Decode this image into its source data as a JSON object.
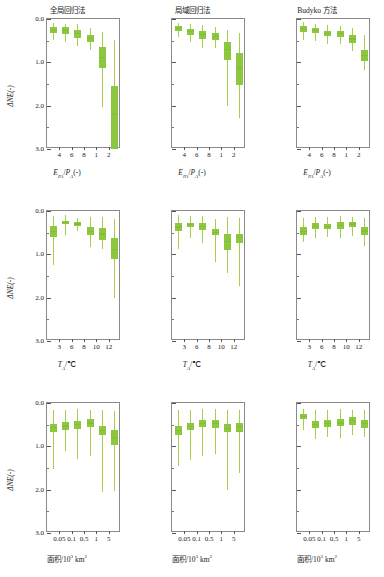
{
  "figure": {
    "ylabel": "ΔNE(-)",
    "y_ticks": [
      "0.0",
      "1.0",
      "2.0",
      "3.0"
    ],
    "ylim_top": 0.0,
    "ylim_bottom": 3.0,
    "box_color": "#8dc63f",
    "whisker_color": "#a8cf4a",
    "axis_color": "#8a8a8a"
  },
  "columns": [
    {
      "title": "全局回归法"
    },
    {
      "title": "局域回归法"
    },
    {
      "title": "Budyko 方法"
    }
  ],
  "rows": [
    {
      "xlabel_html": "<i>E</i><sub>PA</sub>/<i>P</i><sub>A</sub>(-)",
      "xlabel_text": "EPA/PA(-)",
      "x_ticks": [
        "4",
        "6",
        "8",
        "1",
        "2"
      ]
    },
    {
      "xlabel_html": "<i>T</i><sub>A</sub>/℃",
      "xlabel_text": "TA/℃",
      "x_ticks": [
        "3",
        "6",
        "8",
        "10",
        "12"
      ]
    },
    {
      "xlabel_html": "面积/10<sup>3</sup> km<sup>2</sup>",
      "xlabel_text": "面积/10³ km²",
      "x_ticks": [
        "0.05",
        "0.1",
        "0.5",
        "1",
        "5"
      ]
    }
  ],
  "chart_data": {
    "type": "box",
    "title": "",
    "ylabel": "ΔNE(-)",
    "ylim": [
      0.0,
      3.0
    ],
    "y_inverted": true,
    "grid": false,
    "legend": "none",
    "panels": [
      {
        "row": 0,
        "col": 0,
        "title": "全局回归法",
        "xlabel": "EPA/PA(-)",
        "x_ticks": [
          "4",
          "6",
          "8",
          "1",
          "2"
        ],
        "boxes": [
          {
            "whisker_low": 0.1,
            "q1": 0.18,
            "median": 0.26,
            "q3": 0.33,
            "whisker_high": 0.48
          },
          {
            "whisker_low": 0.11,
            "q1": 0.19,
            "median": 0.27,
            "q3": 0.34,
            "whisker_high": 0.52
          },
          {
            "whisker_low": 0.12,
            "q1": 0.26,
            "median": 0.34,
            "q3": 0.43,
            "whisker_high": 0.62
          },
          {
            "whisker_low": 0.2,
            "q1": 0.38,
            "median": 0.45,
            "q3": 0.53,
            "whisker_high": 0.72
          },
          {
            "whisker_low": 0.3,
            "q1": 0.65,
            "median": 0.88,
            "q3": 1.12,
            "whisker_high": 2.02
          },
          {
            "whisker_low": 0.48,
            "q1": 1.55,
            "median": 2.2,
            "q3": 3.0,
            "whisker_high": 3.0
          }
        ]
      },
      {
        "row": 0,
        "col": 1,
        "title": "局域回归法",
        "xlabel": "EPA/PA(-)",
        "x_ticks": [
          "4",
          "6",
          "8",
          "1",
          "2"
        ],
        "boxes": [
          {
            "whisker_low": 0.09,
            "q1": 0.16,
            "median": 0.22,
            "q3": 0.28,
            "whisker_high": 0.42
          },
          {
            "whisker_low": 0.11,
            "q1": 0.22,
            "median": 0.29,
            "q3": 0.36,
            "whisker_high": 0.52
          },
          {
            "whisker_low": 0.13,
            "q1": 0.27,
            "median": 0.36,
            "q3": 0.46,
            "whisker_high": 0.66
          },
          {
            "whisker_low": 0.18,
            "q1": 0.33,
            "median": 0.41,
            "q3": 0.49,
            "whisker_high": 0.68
          },
          {
            "whisker_low": 0.26,
            "q1": 0.52,
            "median": 0.7,
            "q3": 0.95,
            "whisker_high": 2.0
          },
          {
            "whisker_low": 0.33,
            "q1": 0.78,
            "median": 1.15,
            "q3": 1.52,
            "whisker_high": 2.28
          }
        ]
      },
      {
        "row": 0,
        "col": 2,
        "title": "Budyko 方法",
        "xlabel": "EPA/PA(-)",
        "x_ticks": [
          "4",
          "6",
          "8",
          "1",
          "2"
        ],
        "boxes": [
          {
            "whisker_low": 0.08,
            "q1": 0.15,
            "median": 0.22,
            "q3": 0.29,
            "whisker_high": 0.48
          },
          {
            "whisker_low": 0.11,
            "q1": 0.21,
            "median": 0.26,
            "q3": 0.32,
            "whisker_high": 0.5
          },
          {
            "whisker_low": 0.13,
            "q1": 0.27,
            "median": 0.33,
            "q3": 0.4,
            "whisker_high": 0.58
          },
          {
            "whisker_low": 0.15,
            "q1": 0.28,
            "median": 0.34,
            "q3": 0.41,
            "whisker_high": 0.58
          },
          {
            "whisker_low": 0.2,
            "q1": 0.38,
            "median": 0.46,
            "q3": 0.55,
            "whisker_high": 0.75
          },
          {
            "whisker_low": 0.38,
            "q1": 0.72,
            "median": 0.84,
            "q3": 0.97,
            "whisker_high": 1.18
          }
        ]
      },
      {
        "row": 1,
        "col": 0,
        "title": "全局回归法",
        "xlabel": "TA/℃",
        "x_ticks": [
          "3",
          "6",
          "8",
          "10",
          "12"
        ],
        "boxes": [
          {
            "whisker_low": 0.12,
            "q1": 0.34,
            "median": 0.47,
            "q3": 0.6,
            "whisker_high": 1.25
          },
          {
            "whisker_low": 0.1,
            "q1": 0.22,
            "median": 0.26,
            "q3": 0.31,
            "whisker_high": 0.55
          },
          {
            "whisker_low": 0.15,
            "q1": 0.26,
            "median": 0.3,
            "q3": 0.34,
            "whisker_high": 0.45
          },
          {
            "whisker_low": 0.13,
            "q1": 0.38,
            "median": 0.47,
            "q3": 0.55,
            "whisker_high": 0.82
          },
          {
            "whisker_low": 0.13,
            "q1": 0.4,
            "median": 0.53,
            "q3": 0.68,
            "whisker_high": 0.88
          },
          {
            "whisker_low": 0.18,
            "q1": 0.62,
            "median": 0.88,
            "q3": 1.1,
            "whisker_high": 2.0
          }
        ]
      },
      {
        "row": 1,
        "col": 1,
        "title": "局域回归法",
        "xlabel": "TA/℃",
        "x_ticks": [
          "3",
          "6",
          "8",
          "10",
          "12"
        ],
        "boxes": [
          {
            "whisker_low": 0.1,
            "q1": 0.28,
            "median": 0.37,
            "q3": 0.47,
            "whisker_high": 0.88
          },
          {
            "whisker_low": 0.12,
            "q1": 0.27,
            "median": 0.32,
            "q3": 0.37,
            "whisker_high": 0.62
          },
          {
            "whisker_low": 0.11,
            "q1": 0.28,
            "median": 0.36,
            "q3": 0.45,
            "whisker_high": 0.75
          },
          {
            "whisker_low": 0.18,
            "q1": 0.42,
            "median": 0.49,
            "q3": 0.55,
            "whisker_high": 1.18
          },
          {
            "whisker_low": 0.14,
            "q1": 0.52,
            "median": 0.7,
            "q3": 0.9,
            "whisker_high": 1.42
          },
          {
            "whisker_low": 0.16,
            "q1": 0.52,
            "median": 0.62,
            "q3": 0.75,
            "whisker_high": 1.72
          }
        ]
      },
      {
        "row": 1,
        "col": 2,
        "title": "Budyko 方法",
        "xlabel": "TA/℃",
        "x_ticks": [
          "3",
          "6",
          "8",
          "10",
          "12"
        ],
        "boxes": [
          {
            "whisker_low": 0.16,
            "q1": 0.38,
            "median": 0.47,
            "q3": 0.55,
            "whisker_high": 0.72
          },
          {
            "whisker_low": 0.13,
            "q1": 0.28,
            "median": 0.35,
            "q3": 0.42,
            "whisker_high": 0.62
          },
          {
            "whisker_low": 0.14,
            "q1": 0.29,
            "median": 0.35,
            "q3": 0.41,
            "whisker_high": 0.6
          },
          {
            "whisker_low": 0.12,
            "q1": 0.26,
            "median": 0.33,
            "q3": 0.41,
            "whisker_high": 0.62
          },
          {
            "whisker_low": 0.13,
            "q1": 0.25,
            "median": 0.3,
            "q3": 0.36,
            "whisker_high": 0.58
          },
          {
            "whisker_low": 0.16,
            "q1": 0.36,
            "median": 0.46,
            "q3": 0.56,
            "whisker_high": 0.8
          }
        ]
      },
      {
        "row": 2,
        "col": 0,
        "title": "全局回归法",
        "xlabel": "面积/10³ km²",
        "x_ticks": [
          "0.05",
          "0.1",
          "0.5",
          "1",
          "5"
        ],
        "boxes": [
          {
            "whisker_low": 0.16,
            "q1": 0.48,
            "median": 0.57,
            "q3": 0.66,
            "whisker_high": 1.52
          },
          {
            "whisker_low": 0.16,
            "q1": 0.44,
            "median": 0.53,
            "q3": 0.62,
            "whisker_high": 1.1
          },
          {
            "whisker_low": 0.14,
            "q1": 0.42,
            "median": 0.5,
            "q3": 0.6,
            "whisker_high": 1.3
          },
          {
            "whisker_low": 0.15,
            "q1": 0.38,
            "median": 0.46,
            "q3": 0.55,
            "whisker_high": 1.22
          },
          {
            "whisker_low": 0.16,
            "q1": 0.54,
            "median": 0.64,
            "q3": 0.74,
            "whisker_high": 2.05
          },
          {
            "whisker_low": 0.18,
            "q1": 0.62,
            "median": 0.8,
            "q3": 0.98,
            "whisker_high": 2.02
          }
        ]
      },
      {
        "row": 2,
        "col": 1,
        "title": "局域回归法",
        "xlabel": "面积/10³ km²",
        "x_ticks": [
          "0.05",
          "0.1",
          "0.5",
          "1",
          "5"
        ],
        "boxes": [
          {
            "whisker_low": 0.16,
            "q1": 0.54,
            "median": 0.64,
            "q3": 0.74,
            "whisker_high": 1.45
          },
          {
            "whisker_low": 0.15,
            "q1": 0.45,
            "median": 0.54,
            "q3": 0.63,
            "whisker_high": 1.32
          },
          {
            "whisker_low": 0.13,
            "q1": 0.4,
            "median": 0.48,
            "q3": 0.56,
            "whisker_high": 1.22
          },
          {
            "whisker_low": 0.14,
            "q1": 0.4,
            "median": 0.48,
            "q3": 0.57,
            "whisker_high": 1.18
          },
          {
            "whisker_low": 0.16,
            "q1": 0.48,
            "median": 0.58,
            "q3": 0.68,
            "whisker_high": 2.0
          },
          {
            "whisker_low": 0.15,
            "q1": 0.45,
            "median": 0.55,
            "q3": 0.66,
            "whisker_high": 1.62
          }
        ]
      },
      {
        "row": 2,
        "col": 2,
        "title": "Budyko 方法",
        "xlabel": "面积/10³ km²",
        "x_ticks": [
          "0.05",
          "0.1",
          "0.5",
          "1",
          "5"
        ],
        "boxes": [
          {
            "whisker_low": 0.14,
            "q1": 0.26,
            "median": 0.31,
            "q3": 0.37,
            "whisker_high": 0.62
          },
          {
            "whisker_low": 0.16,
            "q1": 0.42,
            "median": 0.5,
            "q3": 0.57,
            "whisker_high": 0.82
          },
          {
            "whisker_low": 0.15,
            "q1": 0.4,
            "median": 0.47,
            "q3": 0.55,
            "whisker_high": 0.78
          },
          {
            "whisker_low": 0.14,
            "q1": 0.38,
            "median": 0.46,
            "q3": 0.54,
            "whisker_high": 0.8
          },
          {
            "whisker_low": 0.15,
            "q1": 0.33,
            "median": 0.41,
            "q3": 0.5,
            "whisker_high": 0.74
          },
          {
            "whisker_low": 0.16,
            "q1": 0.4,
            "median": 0.48,
            "q3": 0.57,
            "whisker_high": 0.78
          }
        ]
      }
    ]
  }
}
